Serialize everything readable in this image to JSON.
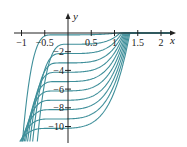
{
  "chart_data": {
    "type": "line",
    "title": "",
    "xlabel": "x",
    "ylabel": "y",
    "xlim": [
      -1.1,
      2.35
    ],
    "ylim": [
      -11.8,
      2.6
    ],
    "grid": false,
    "legend": "none",
    "x_ticks": [
      {
        "value": -1,
        "label": "-1"
      },
      {
        "value": -0.5,
        "label": "-0.5"
      },
      {
        "value": 0.5,
        "label": "0.5"
      },
      {
        "value": 1,
        "label": "1"
      },
      {
        "value": 1.5,
        "label": "1.5"
      },
      {
        "value": 2,
        "label": "2"
      }
    ],
    "y_ticks": [
      {
        "value": -2,
        "label": "-2"
      },
      {
        "value": -4,
        "label": "-4"
      },
      {
        "value": -6,
        "label": "-6"
      },
      {
        "value": -8,
        "label": "-8"
      },
      {
        "value": -10,
        "label": "-10"
      }
    ],
    "curve_color": "#3f8f9a",
    "axis_color": "#222222",
    "series": [
      {
        "name": "C=-0.2",
        "plateau": -0.2,
        "left_x": -0.9,
        "zero_x": 1.05
      },
      {
        "name": "C=-1.2",
        "plateau": -1.2,
        "left_x": -0.58,
        "zero_x": 1.12
      },
      {
        "name": "C=-2.2",
        "plateau": -2.2,
        "left_x": -0.68,
        "zero_x": 1.16
      },
      {
        "name": "C=-3.2",
        "plateau": -3.2,
        "left_x": -0.74,
        "zero_x": 1.19
      },
      {
        "name": "C=-4.2",
        "plateau": -4.2,
        "left_x": -0.79,
        "zero_x": 1.21
      },
      {
        "name": "C=-5.2",
        "plateau": -5.2,
        "left_x": -0.83,
        "zero_x": 1.23
      },
      {
        "name": "C=-6.2",
        "plateau": -6.2,
        "left_x": -0.86,
        "zero_x": 1.25
      },
      {
        "name": "C=-7.2",
        "plateau": -7.2,
        "left_x": -0.89,
        "zero_x": 1.27
      },
      {
        "name": "C=-8.2",
        "plateau": -8.2,
        "left_x": -0.92,
        "zero_x": 1.29
      },
      {
        "name": "C=-9.2",
        "plateau": -9.2,
        "left_x": -0.94,
        "zero_x": 1.31
      },
      {
        "name": "C=-10.2",
        "plateau": -10.2,
        "left_x": -0.96,
        "zero_x": 1.33
      }
    ]
  },
  "axes": {
    "x_label": "x",
    "y_label": "y"
  }
}
